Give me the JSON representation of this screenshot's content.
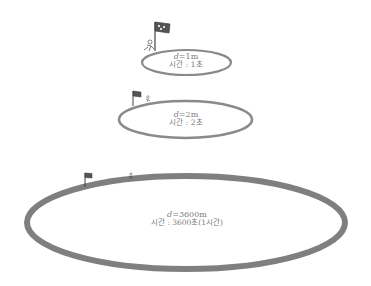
{
  "colors": {
    "track": "#8a8a8a",
    "track_large": "#7f7f7f",
    "text": "#7a7a7a",
    "flag": "#444444"
  },
  "tracks": [
    {
      "id": "small",
      "distance_var": "d",
      "distance_value": "=1m",
      "time_label": "시간 : 1초",
      "flag_icon": "finish-flag-icon",
      "runner_icon": "runner-icon"
    },
    {
      "id": "medium",
      "distance_var": "d",
      "distance_value": "=2m",
      "time_label": "시간 : 2초",
      "flag_icon": "finish-flag-icon",
      "runner_icon": "runner-icon"
    },
    {
      "id": "large",
      "distance_var": "d",
      "distance_value": "=3600m",
      "time_label": "시간 : 3600초(1시간)",
      "flag_icon": "finish-flag-icon",
      "runner_icon": "runner-icon"
    }
  ]
}
